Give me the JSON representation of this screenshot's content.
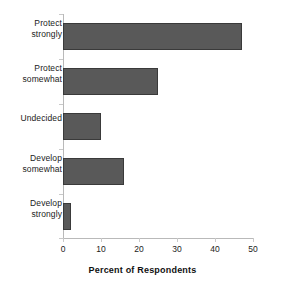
{
  "chart_data": {
    "type": "bar",
    "orientation": "horizontal",
    "title": "",
    "xlabel": "Percent of Respondents",
    "ylabel": "",
    "categories": [
      "Protect strongly",
      "Protect somewhat",
      "Undecided",
      "Develop somewhat",
      "Develop strongly"
    ],
    "category_lines": [
      [
        "Protect",
        "strongly"
      ],
      [
        "Protect",
        "somewhat"
      ],
      [
        "Undecided"
      ],
      [
        "Develop",
        "somewhat"
      ],
      [
        "Develop",
        "strongly"
      ]
    ],
    "values": [
      47,
      25,
      10,
      16,
      2
    ],
    "xlim": [
      0,
      50
    ],
    "xticks": [
      0,
      10,
      20,
      30,
      40,
      50
    ],
    "xtick_labels": [
      "0",
      "10",
      "20",
      "30",
      "40",
      "50"
    ],
    "grid": false,
    "legend": false,
    "bar_color": "#595959",
    "bar_border_color": "#3a3a3a",
    "axis_color": "#b9b9b9",
    "text_color": "#1b1b1b"
  }
}
